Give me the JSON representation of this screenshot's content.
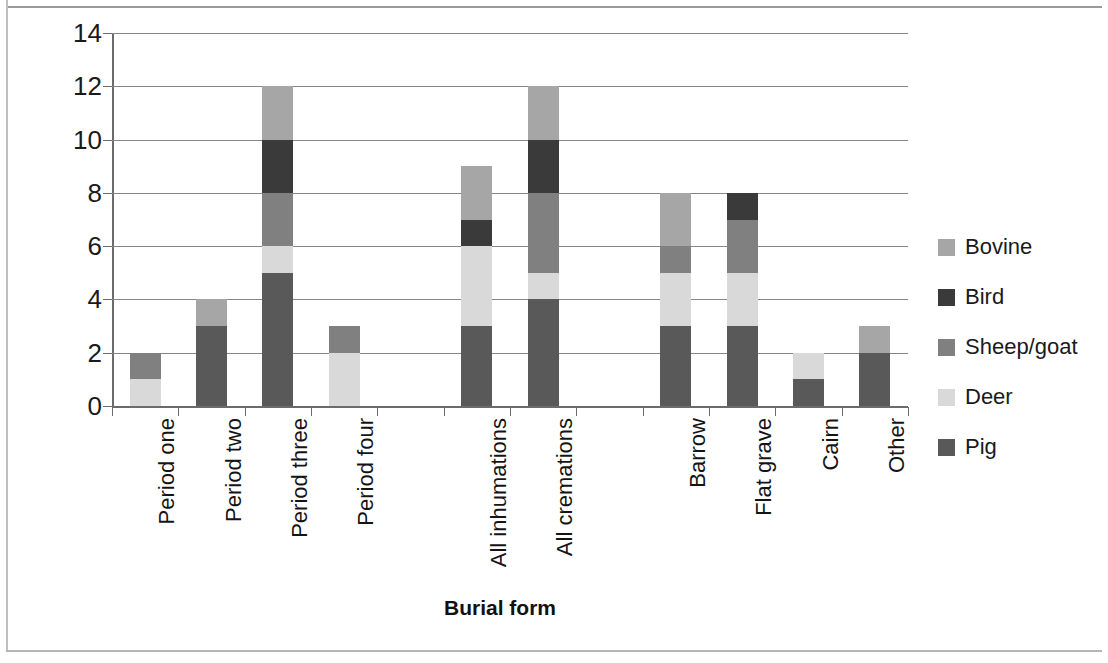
{
  "chart_data": {
    "type": "bar",
    "subtype": "stacked-vertical",
    "title": "",
    "xlabel": "Burial form",
    "ylabel": "Number of burials",
    "ylim": [
      0,
      14
    ],
    "ytick_step": 2,
    "yticks": [
      0,
      2,
      4,
      6,
      8,
      10,
      12,
      14
    ],
    "grid": "horizontal",
    "legend_position": "right",
    "categories": [
      "Period one",
      "Period two",
      "Period three",
      "Period four",
      "",
      "All inhumations",
      "All cremations",
      "",
      "Barrow",
      "Flat grave",
      "Cairn",
      "Other"
    ],
    "series": [
      {
        "name": "Pig",
        "color": "#595959",
        "values": [
          0,
          3,
          5,
          0,
          0,
          3,
          4,
          0,
          3,
          3,
          1,
          2
        ]
      },
      {
        "name": "Deer",
        "color": "#d9d9d9",
        "values": [
          1,
          0,
          1,
          2,
          0,
          3,
          1,
          0,
          2,
          2,
          1,
          0
        ]
      },
      {
        "name": "Sheep/goat",
        "color": "#808080",
        "values": [
          1,
          0,
          2,
          1,
          0,
          0,
          3,
          0,
          1,
          2,
          0,
          0
        ]
      },
      {
        "name": "Bird",
        "color": "#3a3a3a",
        "values": [
          0,
          0,
          2,
          0,
          0,
          1,
          2,
          0,
          0,
          1,
          0,
          0
        ]
      },
      {
        "name": "Bovine",
        "color": "#a6a6a6",
        "values": [
          0,
          1,
          2,
          0,
          0,
          2,
          2,
          0,
          2,
          0,
          0,
          1
        ]
      }
    ],
    "stack_order": [
      "Pig",
      "Deer",
      "Sheep/goat",
      "Bird",
      "Bovine"
    ],
    "totals": [
      2,
      4,
      12,
      3,
      0,
      9,
      12,
      0,
      8,
      8,
      2,
      3
    ]
  },
  "legend": {
    "items": [
      {
        "label": "Bovine",
        "color": "#a6a6a6"
      },
      {
        "label": "Bird",
        "color": "#3a3a3a"
      },
      {
        "label": "Sheep/goat",
        "color": "#808080"
      },
      {
        "label": "Deer",
        "color": "#d9d9d9"
      },
      {
        "label": "Pig",
        "color": "#595959"
      }
    ]
  },
  "axes": {
    "y_title": "Number of burials",
    "x_title": "Burial form"
  }
}
